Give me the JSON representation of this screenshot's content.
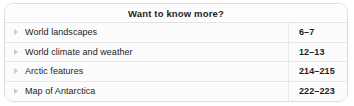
{
  "panel": {
    "header": {
      "title": "Want to know more?"
    },
    "columns": {
      "topic_header": "",
      "pages_header": ""
    },
    "rows": [
      {
        "bullet": "triangle-right-icon",
        "label": "World landscapes",
        "pages": "6–7"
      },
      {
        "bullet": "triangle-right-icon",
        "label": "World climate and weather",
        "pages": "12–13"
      },
      {
        "bullet": "triangle-right-icon",
        "label": "Arctic features",
        "pages": "214–215"
      },
      {
        "bullet": "triangle-right-icon",
        "label": "Map of Antarctica",
        "pages": "222–223"
      }
    ]
  },
  "colors": {
    "panel_background": "#fcfcfd",
    "panel_border": "#dcdee1",
    "row_separator": "#e6e8ea",
    "text": "#1d1d1f",
    "bullet": "#c9ccd0"
  }
}
